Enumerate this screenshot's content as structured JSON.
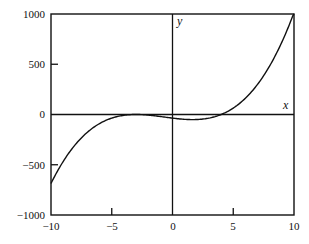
{
  "chart_data": {
    "type": "line",
    "title": "",
    "xlabel": "x",
    "ylabel": "y",
    "xlim": [
      -10,
      10
    ],
    "ylim": [
      -1000,
      1000
    ],
    "grid": false,
    "legend": null,
    "x_ticks": [
      -10,
      -5,
      0,
      5,
      10
    ],
    "y_ticks": [
      -1000,
      -500,
      0,
      500,
      1000
    ],
    "x_tick_labels": [
      "−10",
      "−5",
      "0",
      "5",
      "10"
    ],
    "y_tick_labels": [
      "−1000",
      "−500",
      "0",
      "500",
      "1000"
    ],
    "series": [
      {
        "name": "y = (x+3)^2 (x-4)",
        "x": [
          -10,
          -9,
          -8,
          -7,
          -6,
          -5,
          -4,
          -3,
          -2,
          -1,
          0,
          1,
          1.67,
          2,
          3,
          4,
          5,
          6,
          7,
          8,
          9,
          10
        ],
        "values": [
          -686,
          -468,
          -300,
          -176,
          -90,
          -36,
          -8,
          0,
          -6,
          -20,
          -36,
          -48,
          -51,
          -50,
          -36,
          0,
          64,
          162,
          300,
          484,
          720,
          1014
        ]
      }
    ],
    "annotations": [
      {
        "text": "y",
        "position": "top of y-axis"
      },
      {
        "text": "x",
        "position": "right end of x-axis"
      }
    ]
  },
  "labels": {
    "x_axis": "x",
    "y_axis": "y",
    "y_ticks": [
      "1000",
      "500",
      "0",
      "−500",
      "−1000"
    ],
    "x_ticks": [
      "−10",
      "−5",
      "0",
      "5",
      "10"
    ]
  }
}
